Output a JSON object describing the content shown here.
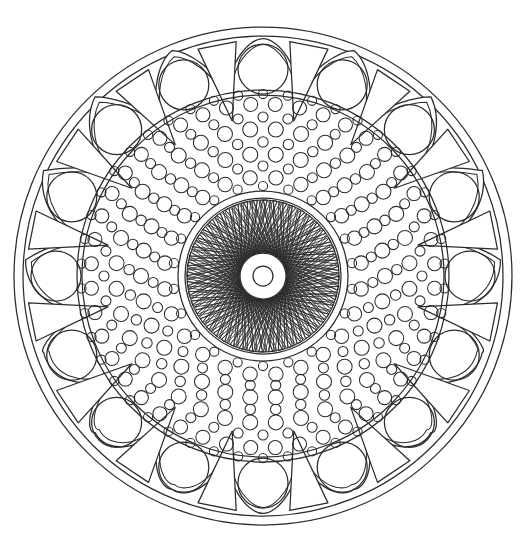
{
  "artwork": {
    "title": "Mandala Coloring Page",
    "type": "line-art-mandala",
    "medium": "black outline on white",
    "canvas": {
      "width": 527,
      "height": 553
    },
    "center": {
      "x": 263,
      "y": 276
    },
    "colors": {
      "background": "#ffffff",
      "stroke": "#2b2b2b"
    }
  },
  "rings": [
    {
      "name": "outer-border-ring",
      "description": "Plain outermost circular band",
      "outer_radius": 249,
      "inner_radius": 240,
      "element_count": 0
    },
    {
      "name": "arch-petal-ring",
      "description": "Ring of dome/arch shapes each containing a circle, separated by narrow inward-pointing triangular spikes",
      "outer_radius": 238,
      "inner_radius": 186,
      "element_count": 16,
      "arch_circle_radius": 25,
      "arch_circle_center_radius": 207
    },
    {
      "name": "spike-ring",
      "description": "Narrow elongated triangles pointing inward, interleaved between arches",
      "element_count": 16,
      "tip_radius": 158,
      "base_radius": 236
    },
    {
      "name": "inner-boundary-ring",
      "description": "Double circle separating arch ring from dot field",
      "outer_radius": 186,
      "inner_radius": 181
    },
    {
      "name": "dot-field",
      "description": "Dense concentric rings of small open circles (dots), alternating larger and smaller sizes",
      "outer_radius": 179,
      "inner_radius": 86,
      "ring_count": 12
    },
    {
      "name": "core-boundary-ring",
      "description": "Double circle enclosing the spirograph core",
      "outer_radius": 85,
      "inner_radius": 78
    },
    {
      "name": "spirograph-core",
      "description": "Radiating elongated spindle/needle shapes forming a woven star rosette",
      "outer_radius": 76,
      "inner_radius": 24,
      "element_count": 48
    },
    {
      "name": "center-hub",
      "description": "White circular hub at very center with a small concentric circle",
      "outer_radius": 23,
      "inner_radius": 10
    }
  ],
  "dot_rings": [
    {
      "ring_radius": 172,
      "dot_radius": 7.0,
      "count": 44
    },
    {
      "ring_radius": 159,
      "dot_radius": 5.0,
      "count": 40
    },
    {
      "ring_radius": 147,
      "dot_radius": 7.5,
      "count": 36
    },
    {
      "ring_radius": 134,
      "dot_radius": 5.2,
      "count": 33
    },
    {
      "ring_radius": 122,
      "dot_radius": 7.5,
      "count": 30
    },
    {
      "ring_radius": 110,
      "dot_radius": 5.0,
      "count": 27
    },
    {
      "ring_radius": 99,
      "dot_radius": 7.2,
      "count": 24
    },
    {
      "ring_radius": 182,
      "dot_radius": 4.6,
      "count": 46
    },
    {
      "ring_radius": 90,
      "dot_radius": 4.6,
      "count": 22
    }
  ]
}
